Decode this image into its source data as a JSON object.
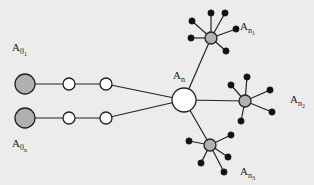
{
  "diagram": {
    "background": "#ececec",
    "colors": {
      "stroke": "#222222",
      "grey_fill": "#b0b0b0",
      "white_fill": "#ffffff",
      "leaf_fill": "#111111"
    },
    "labels": [
      {
        "id": "a01",
        "base": "A",
        "sub": "0",
        "subsub": "1",
        "x": 12,
        "y": 42
      },
      {
        "id": "a0n",
        "base": "A",
        "sub": "0",
        "subsub": "n",
        "x": 12,
        "y": 138
      },
      {
        "id": "an",
        "base": "A",
        "sub": "n",
        "subsub": "",
        "x": 173,
        "y": 70
      },
      {
        "id": "an1",
        "base": "A",
        "sub": "n",
        "subsub": "1",
        "x": 240,
        "y": 21
      },
      {
        "id": "an2",
        "base": "A",
        "sub": "n",
        "subsub": "2",
        "x": 290,
        "y": 94
      },
      {
        "id": "an3",
        "base": "A",
        "sub": "n",
        "subsub": "3",
        "x": 240,
        "y": 166
      }
    ],
    "chains": [
      {
        "source": {
          "x": 25,
          "y": 84,
          "r": 10
        },
        "mids": [
          {
            "x": 69,
            "y": 84,
            "r": 6
          },
          {
            "x": 106,
            "y": 84,
            "r": 6
          }
        ]
      },
      {
        "source": {
          "x": 25,
          "y": 118,
          "r": 10
        },
        "mids": [
          {
            "x": 69,
            "y": 118,
            "r": 6
          },
          {
            "x": 106,
            "y": 118,
            "r": 6
          }
        ]
      }
    ],
    "hub": {
      "x": 184,
      "y": 100,
      "r": 12
    },
    "stars": [
      {
        "id": "top",
        "x": 211,
        "y": 38,
        "r": 6,
        "leaves": [
          [
            192,
            21
          ],
          [
            211,
            13
          ],
          [
            225,
            13
          ],
          [
            236,
            29
          ],
          [
            191,
            38
          ],
          [
            226,
            51
          ]
        ]
      },
      {
        "id": "right",
        "x": 245,
        "y": 101,
        "r": 6,
        "leaves": [
          [
            231,
            85
          ],
          [
            247,
            77
          ],
          [
            270,
            90
          ],
          [
            272,
            112
          ],
          [
            241,
            121
          ]
        ]
      },
      {
        "id": "bottom",
        "x": 210,
        "y": 145,
        "r": 6,
        "leaves": [
          [
            189,
            141
          ],
          [
            231,
            135
          ],
          [
            228,
            157
          ],
          [
            201,
            163
          ],
          [
            224,
            172
          ]
        ]
      }
    ],
    "leaf_radius": 3.2
  }
}
